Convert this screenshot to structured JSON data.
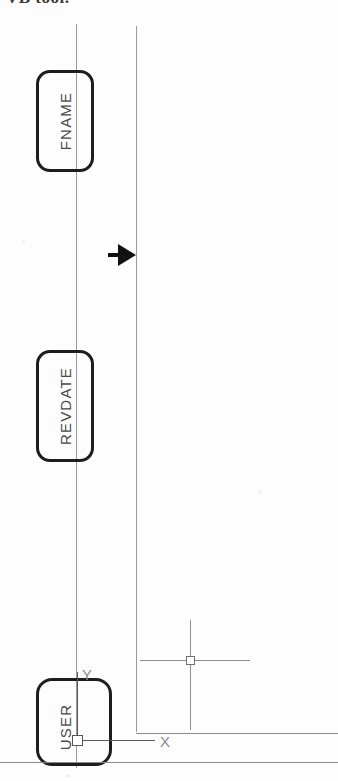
{
  "document": {
    "type": "cad-drawing-excerpt",
    "caption": "VB tool.",
    "background_color": "#fdfdfd",
    "ink_color": "#1d1d1d",
    "construction_line_color": "#9a9a9a"
  },
  "attribute_boxes": [
    {
      "id": "fname",
      "label": "FNAME",
      "orientation": "vertical-bottom-to-top"
    },
    {
      "id": "revdate",
      "label": "REVDATE",
      "orientation": "vertical-bottom-to-top"
    },
    {
      "id": "user",
      "label": "USER",
      "orientation": "vertical-bottom-to-top"
    }
  ],
  "ucs_icon": {
    "x_axis_label": "X",
    "y_axis_label": "Y",
    "origin_marker": "square"
  },
  "markers": {
    "arrow_label": "selection-arrow",
    "crosshair_label": "crosshair-cursor",
    "pickbox_label": "pickbox"
  }
}
